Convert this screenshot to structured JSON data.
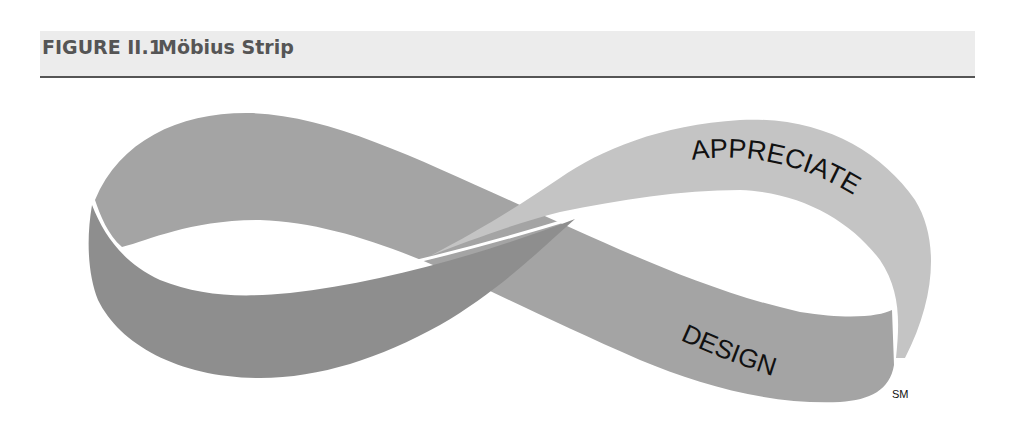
{
  "figure": {
    "label": "FIGURE II.1",
    "title": "Möbius Strip"
  },
  "diagram": {
    "type": "mobius-strip-infinity",
    "upper_band_text": "APPRECIATE",
    "lower_band_text": "DESIGN",
    "service_mark": "SM",
    "colors": {
      "light_band": "#c4c4c4",
      "medium_band": "#a4a4a4",
      "dark_band": "#8e8e8e",
      "header_bg": "#ececec",
      "header_rule": "#555555",
      "header_text": "#555555"
    }
  }
}
